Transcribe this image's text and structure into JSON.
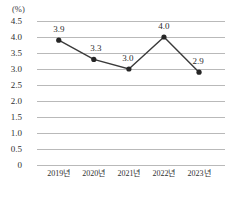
{
  "chart_data": {
    "type": "line",
    "title": "",
    "subtitle": "",
    "xlabel": "",
    "ylabel": "",
    "unit_label": "(%)",
    "categories": [
      "2019년",
      "2020년",
      "2021년",
      "2022년",
      "2023년"
    ],
    "values": [
      3.9,
      3.3,
      3.0,
      4.0,
      2.9
    ],
    "point_labels": [
      "3.9",
      "3.3",
      "3.0",
      "4.0",
      "2.9"
    ],
    "ylim": [
      0,
      4.5
    ],
    "yticks": [
      4.5,
      4.0,
      3.5,
      3.0,
      2.5,
      2.0,
      1.5,
      1.0,
      0.5,
      0
    ],
    "ytick_labels": [
      "4.5",
      "4.0",
      "3.5",
      "3.0",
      "2.5",
      "2.0",
      "1.5",
      "1.0",
      "0.5",
      "0"
    ],
    "grid": true,
    "legend": false,
    "series": [
      {
        "name": "",
        "values": [
          3.9,
          3.3,
          3.0,
          4.0,
          2.9
        ]
      }
    ],
    "colors": {
      "line": "#3a3a3a",
      "marker": "#262626",
      "grid": "#b9b9b9",
      "text": "#2b2b2b",
      "background": "#ffffff"
    }
  }
}
